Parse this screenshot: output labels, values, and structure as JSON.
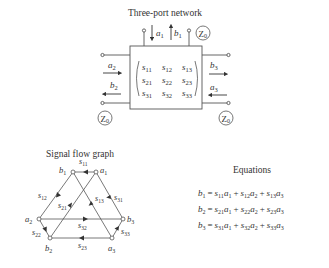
{
  "network": {
    "title": "Three-port network",
    "matrix": [
      [
        "s",
        "11",
        "s",
        "12",
        "s",
        "13"
      ],
      [
        "s",
        "21",
        "s",
        "22",
        "s",
        "23"
      ],
      [
        "s",
        "31",
        "s",
        "32",
        "s",
        "33"
      ]
    ],
    "impedance_label": "Z",
    "impedance_sub": "0",
    "ports": {
      "a1": {
        "v": "a",
        "s": "1"
      },
      "b1": {
        "v": "b",
        "s": "1"
      },
      "a2": {
        "v": "a",
        "s": "2"
      },
      "b2": {
        "v": "b",
        "s": "2"
      },
      "a3": {
        "v": "a",
        "s": "3"
      },
      "b3": {
        "v": "b",
        "s": "3"
      }
    }
  },
  "flow_graph": {
    "title": "Signal flow graph",
    "nodes": {
      "b1": {
        "v": "b",
        "s": "1"
      },
      "a1": {
        "v": "a",
        "s": "1"
      },
      "a2": {
        "v": "a",
        "s": "2"
      },
      "b3": {
        "v": "b",
        "s": "3"
      },
      "b2": {
        "v": "b",
        "s": "2"
      },
      "a3": {
        "v": "a",
        "s": "3"
      }
    },
    "edges": {
      "s11": {
        "v": "s",
        "s": "11"
      },
      "s12": {
        "v": "s",
        "s": "12"
      },
      "s13": {
        "v": "s",
        "s": "13"
      },
      "s21": {
        "v": "s",
        "s": "21"
      },
      "s22": {
        "v": "s",
        "s": "22"
      },
      "s23": {
        "v": "s",
        "s": "23"
      },
      "s31": {
        "v": "s",
        "s": "31"
      },
      "s32": {
        "v": "s",
        "s": "32"
      },
      "s33": {
        "v": "s",
        "s": "33"
      }
    }
  },
  "equations": {
    "title": "Equations",
    "lines": [
      {
        "lhs": "b",
        "lhs_sub": "1",
        "terms": [
          [
            "s",
            "11",
            "a",
            "1"
          ],
          [
            "s",
            "12",
            "a",
            "2"
          ],
          [
            "s",
            "13",
            "a",
            "3"
          ]
        ]
      },
      {
        "lhs": "b",
        "lhs_sub": "2",
        "terms": [
          [
            "s",
            "21",
            "a",
            "1"
          ],
          [
            "s",
            "22",
            "a",
            "2"
          ],
          [
            "s",
            "23",
            "a",
            "3"
          ]
        ]
      },
      {
        "lhs": "b",
        "lhs_sub": "3",
        "terms": [
          [
            "s",
            "31",
            "a",
            "1"
          ],
          [
            "s",
            "32",
            "a",
            "2"
          ],
          [
            "s",
            "33",
            "a",
            "3"
          ]
        ]
      }
    ],
    "eq": "=",
    "plus": "+"
  }
}
